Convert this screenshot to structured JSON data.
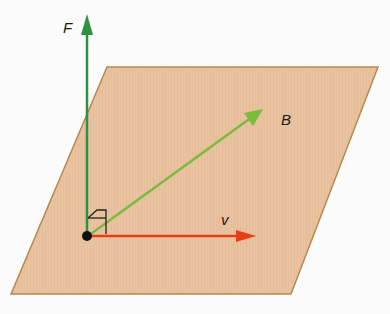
{
  "diagram": {
    "title": "",
    "labels": {
      "force": "F",
      "magnetic_field": "B",
      "velocity": "v"
    },
    "colors": {
      "plane_fill": "#e9c29f",
      "plane_edge": "#b58a4e",
      "force_arrow": "#2e9141",
      "field_arrow": "#7dbb3f",
      "velocity_arrow": "#e6401a",
      "origin_dot": "#111111",
      "right_angle_mark": "#222222"
    },
    "elements": [
      {
        "name": "plane",
        "type": "parallelogram"
      },
      {
        "name": "force-vector",
        "label": "F",
        "direction": "up (perpendicular to plane)"
      },
      {
        "name": "field-vector",
        "label": "B",
        "direction": "diagonal in plane"
      },
      {
        "name": "velocity-vector",
        "label": "v",
        "direction": "right in plane"
      },
      {
        "name": "origin-point",
        "type": "dot"
      },
      {
        "name": "right-angle-marker",
        "type": "marker"
      }
    ]
  }
}
